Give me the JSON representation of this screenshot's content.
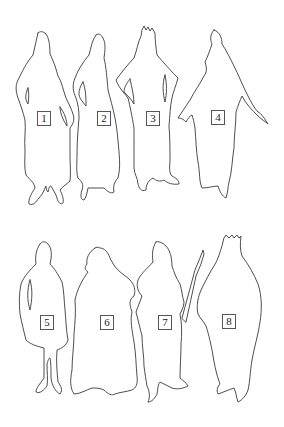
{
  "figures": [
    {
      "id": 1,
      "label": "1",
      "label_pos": [
        37,
        111
      ],
      "description": "standing figure, hands on hips, long robe"
    },
    {
      "id": 2,
      "label": "2",
      "label_pos": [
        97,
        111
      ],
      "description": "standing figure, long robe"
    },
    {
      "id": 3,
      "label": "3",
      "label_pos": [
        146,
        111
      ],
      "description": "crowned figure, arms akimbo"
    },
    {
      "id": 4,
      "label": "4",
      "label_pos": [
        211,
        110
      ],
      "description": "figure with arms extended, long robe"
    },
    {
      "id": 5,
      "label": "5",
      "label_pos": [
        40,
        315
      ],
      "description": "standing figure, knee-length tunic"
    },
    {
      "id": 6,
      "label": "6",
      "label_pos": [
        100,
        315
      ],
      "description": "figure in wide robe"
    },
    {
      "id": 7,
      "label": "7",
      "label_pos": [
        158,
        315
      ],
      "description": "figure holding spear"
    },
    {
      "id": 8,
      "label": "8",
      "label_pos": [
        222,
        314
      ],
      "description": "crowned figure in cloak"
    }
  ],
  "colors": {
    "background": "#ffffff",
    "outline": "#3a3a3a",
    "label_border": "#555555"
  }
}
